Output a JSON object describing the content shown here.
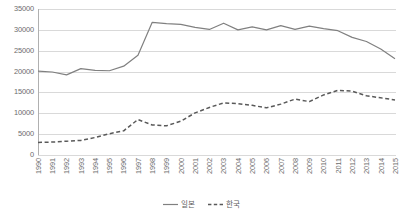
{
  "chart_data": {
    "type": "line",
    "title": "",
    "xlabel": "",
    "ylabel": "",
    "ylim": [
      0,
      35000
    ],
    "y_ticks": [
      0,
      5000,
      10000,
      15000,
      20000,
      25000,
      30000,
      35000
    ],
    "y_tick_labels": [
      "0",
      "5000",
      "10000",
      "15000",
      "20000",
      "25000",
      "30000",
      "35000"
    ],
    "grid": true,
    "grid_axis": "y",
    "legend_position": "bottom-center",
    "categories": [
      "1990",
      "1991",
      "1992",
      "1993",
      "1994",
      "1995",
      "1996",
      "1997",
      "1998",
      "1999",
      "2000",
      "2001",
      "2002",
      "2003",
      "2004",
      "2005",
      "2006",
      "2007",
      "2008",
      "2009",
      "2010",
      "2011",
      "2012",
      "2013",
      "2014",
      "2015"
    ],
    "series": [
      {
        "name": "일본",
        "style": "solid",
        "color": "#808080",
        "values": [
          20100,
          19900,
          19200,
          20700,
          20300,
          20200,
          21300,
          23900,
          31800,
          31500,
          31300,
          30600,
          30100,
          31600,
          30000,
          30700,
          30000,
          31000,
          30100,
          30900,
          30300,
          29800,
          28200,
          27200,
          25400,
          23100
        ]
      },
      {
        "name": "한국",
        "style": "dashed",
        "color": "#595959",
        "values": [
          3000,
          3100,
          3300,
          3500,
          4200,
          5100,
          5800,
          8500,
          7200,
          7000,
          8100,
          10100,
          11400,
          12500,
          12300,
          11900,
          11300,
          12200,
          13400,
          12800,
          14400,
          15500,
          15300,
          14200,
          13700,
          13200
        ]
      }
    ]
  },
  "legend": {
    "entries": [
      {
        "label": "일본",
        "style": "solid"
      },
      {
        "label": "한국",
        "style": "dashed"
      }
    ]
  }
}
